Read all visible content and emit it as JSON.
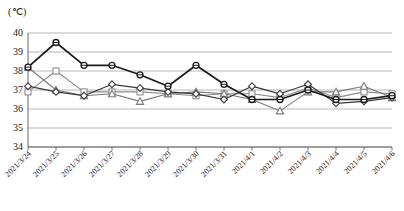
{
  "chart_data": {
    "type": "line",
    "title": "",
    "subtitle": "",
    "unit_label": "(℃)",
    "xlabel": "",
    "ylabel": "",
    "ylim": [
      34,
      40
    ],
    "yticks": [
      34,
      35,
      36,
      37,
      38,
      39,
      40
    ],
    "grid": true,
    "legend_position": "none",
    "categories": [
      "2021/3/24",
      "2021/3/25",
      "2021/3/26",
      "2021/3/27",
      "2021/3/28",
      "2021/3/29",
      "2021/3/30",
      "2021/3/31",
      "2021/4/1",
      "2021/4/2",
      "2021/4/3",
      "2021/4/4",
      "2021/4/5",
      "2021/4/6"
    ],
    "series": [
      {
        "name": "series-1",
        "marker": "circle",
        "color": "#1c1c1c",
        "values": [
          38.2,
          39.5,
          38.3,
          38.3,
          37.8,
          37.2,
          38.3,
          37.3,
          36.5,
          36.5,
          37.0,
          36.5,
          36.5,
          36.7
        ]
      },
      {
        "name": "series-2",
        "marker": "diamond",
        "color": "#3a3a3a",
        "values": [
          37.2,
          36.9,
          36.7,
          37.3,
          37.1,
          36.9,
          36.8,
          36.5,
          37.2,
          36.8,
          37.3,
          36.3,
          36.4,
          36.6
        ]
      },
      {
        "name": "series-3",
        "marker": "square",
        "color": "#8c8c8c",
        "values": [
          36.9,
          38.0,
          36.9,
          36.9,
          36.9,
          36.8,
          36.7,
          36.8,
          36.8,
          36.6,
          37.1,
          36.6,
          36.9,
          36.8
        ]
      },
      {
        "name": "series-4",
        "marker": "triangle",
        "color": "#7a7a7a",
        "values": [
          38.2,
          37.0,
          36.7,
          36.8,
          36.4,
          36.8,
          36.9,
          36.8,
          36.5,
          35.9,
          36.9,
          36.9,
          37.2,
          36.6
        ]
      }
    ]
  },
  "axes": {
    "plot": {
      "left": 28,
      "right": 392,
      "top": 33,
      "bottom": 147
    }
  }
}
